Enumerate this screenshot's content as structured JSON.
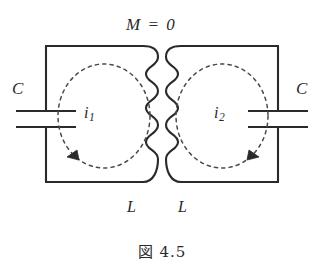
{
  "figure": {
    "caption": "図 4.5",
    "coupling_label": "M = 0",
    "capacitor_left_label": "C",
    "capacitor_right_label": "C",
    "inductor_left_label": "L",
    "inductor_right_label": "L",
    "current_left": {
      "symbol": "i",
      "subscript": "1"
    },
    "current_right": {
      "symbol": "i",
      "subscript": "2"
    },
    "colors": {
      "ink": "#2a2a2a",
      "background": "#ffffff",
      "dashed_loop": "#4a4a4a"
    }
  }
}
